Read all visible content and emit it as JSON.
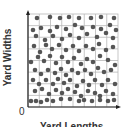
{
  "diagram": {
    "y_axis_label": "Yard Widths",
    "x_axis_label": "Yard Lengths",
    "origin_label": "0",
    "grid": {
      "columns": 8,
      "rows": 8
    },
    "colors": {
      "dot": "#555555",
      "grid": "#b8b8b8",
      "axis": "#222222"
    },
    "dots": [
      [
        37,
        18
      ],
      [
        50,
        17
      ],
      [
        60,
        18
      ],
      [
        69,
        17
      ],
      [
        79,
        18
      ],
      [
        91,
        18
      ],
      [
        101,
        17
      ],
      [
        114,
        18
      ],
      [
        33,
        30
      ],
      [
        41,
        28
      ],
      [
        50,
        31
      ],
      [
        57,
        27
      ],
      [
        66,
        29
      ],
      [
        75,
        25
      ],
      [
        82,
        28
      ],
      [
        93,
        27
      ],
      [
        101,
        29
      ],
      [
        110,
        25
      ],
      [
        116,
        30
      ],
      [
        36,
        36
      ],
      [
        45,
        40
      ],
      [
        53,
        36
      ],
      [
        62,
        39
      ],
      [
        70,
        35
      ],
      [
        79,
        38
      ],
      [
        87,
        34
      ],
      [
        97,
        37
      ],
      [
        106,
        33
      ],
      [
        113,
        38
      ],
      [
        34,
        46
      ],
      [
        40,
        52
      ],
      [
        46,
        45
      ],
      [
        52,
        49
      ],
      [
        59,
        45
      ],
      [
        66,
        50
      ],
      [
        73,
        46
      ],
      [
        79,
        51
      ],
      [
        86,
        46
      ],
      [
        93,
        49
      ],
      [
        99,
        44
      ],
      [
        106,
        50
      ],
      [
        113,
        47
      ],
      [
        31,
        62
      ],
      [
        38,
        57
      ],
      [
        44,
        61
      ],
      [
        50,
        56
      ],
      [
        56,
        63
      ],
      [
        62,
        57
      ],
      [
        68,
        62
      ],
      [
        74,
        58
      ],
      [
        81,
        64
      ],
      [
        87,
        59
      ],
      [
        93,
        62
      ],
      [
        100,
        56
      ],
      [
        108,
        60
      ],
      [
        115,
        65
      ],
      [
        35,
        70
      ],
      [
        41,
        74
      ],
      [
        48,
        70
      ],
      [
        55,
        73
      ],
      [
        61,
        69
      ],
      [
        66,
        75
      ],
      [
        72,
        70
      ],
      [
        78,
        73
      ],
      [
        85,
        70
      ],
      [
        91,
        74
      ],
      [
        98,
        68
      ],
      [
        104,
        72
      ],
      [
        111,
        70
      ],
      [
        33,
        80
      ],
      [
        39,
        84
      ],
      [
        46,
        80
      ],
      [
        53,
        84
      ],
      [
        58,
        79
      ],
      [
        64,
        83
      ],
      [
        70,
        80
      ],
      [
        77,
        86
      ],
      [
        83,
        81
      ],
      [
        89,
        85
      ],
      [
        95,
        80
      ],
      [
        102,
        85
      ],
      [
        108,
        80
      ],
      [
        115,
        84
      ],
      [
        35,
        91
      ],
      [
        42,
        89
      ],
      [
        49,
        94
      ],
      [
        56,
        90
      ],
      [
        62,
        93
      ],
      [
        68,
        89
      ],
      [
        75,
        92
      ],
      [
        81,
        96
      ],
      [
        88,
        91
      ],
      [
        95,
        93
      ],
      [
        100,
        96
      ],
      [
        106,
        91
      ],
      [
        113,
        94
      ],
      [
        31,
        101
      ],
      [
        36,
        101
      ],
      [
        41,
        102
      ],
      [
        47,
        100
      ],
      [
        53,
        101
      ],
      [
        61,
        99
      ],
      [
        70,
        99
      ],
      [
        79,
        101
      ],
      [
        84,
        100
      ],
      [
        92,
        101
      ],
      [
        100,
        100
      ],
      [
        108,
        101
      ],
      [
        114,
        100
      ]
    ]
  }
}
